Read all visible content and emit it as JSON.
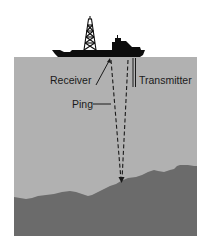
{
  "diagram": {
    "type": "echo-sounding illustration",
    "labels": {
      "receiver": "Receiver",
      "transmitter": "Transmitter",
      "ping": "Ping"
    },
    "colors": {
      "background": "#ffffff",
      "water": "#b1b1b1",
      "seabed": "#6b6b6b",
      "ship": "#0d0d0d",
      "lines": "#1a1a1a"
    },
    "elements": [
      {
        "name": "ship",
        "description": "Survey ship with drilling derrick on the water surface"
      },
      {
        "name": "water",
        "description": "Water column"
      },
      {
        "name": "seabed",
        "description": "Uneven ocean floor"
      },
      {
        "name": "ping-path",
        "description": "Dashed sound path from transmitter to seabed and back to receiver"
      }
    ]
  }
}
